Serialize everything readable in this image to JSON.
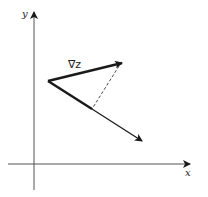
{
  "diagram": {
    "axes": {
      "x_label": "x",
      "y_label": "y"
    },
    "vectors": [
      {
        "name": "gradient",
        "label": "∇z",
        "from": [
          48,
          81
        ],
        "to": [
          123,
          63
        ],
        "style": "thick"
      },
      {
        "name": "direction",
        "label": "",
        "from": [
          48,
          81
        ],
        "to": [
          143,
          142
        ],
        "style": "thick-then-thin"
      }
    ],
    "projection": {
      "from": [
        119,
        66
      ],
      "to": [
        92,
        109
      ],
      "style": "dashed"
    },
    "colors": {
      "ink": "#1a1a1a",
      "background": "#ffffff"
    }
  }
}
